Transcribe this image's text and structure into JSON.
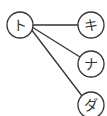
{
  "diagram": {
    "type": "tree",
    "colors": {
      "stroke": "#333333",
      "background": "#ffffff"
    },
    "root": {
      "label": "ト",
      "cx": 20,
      "cy": 25,
      "r": 13
    },
    "children": [
      {
        "label": "キ",
        "cx": 91,
        "cy": 25,
        "r": 13
      },
      {
        "label": "ナ",
        "cx": 91,
        "cy": 64,
        "r": 13
      },
      {
        "label": "ダ",
        "cx": 91,
        "cy": 105,
        "r": 13
      }
    ],
    "edges": [
      {
        "from": "ト",
        "to": "キ"
      },
      {
        "from": "ト",
        "to": "ナ"
      },
      {
        "from": "ト",
        "to": "ダ"
      }
    ]
  }
}
